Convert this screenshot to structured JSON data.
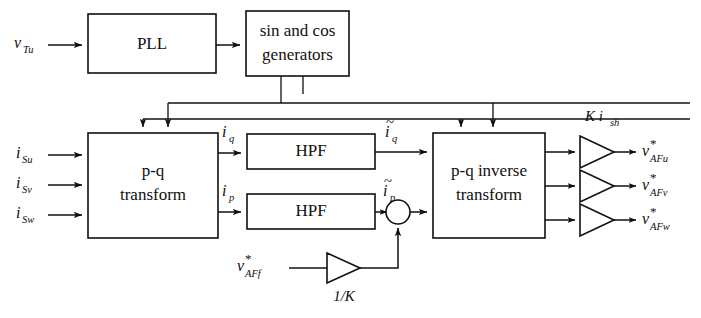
{
  "diagram": {
    "blocks": [
      {
        "id": "pll",
        "label": "PLL"
      },
      {
        "id": "sincos",
        "label_line1": "sin and cos",
        "label_line2": "generators"
      },
      {
        "id": "pq",
        "label_line1": "p-q",
        "label_line2": "transform"
      },
      {
        "id": "hpf_q",
        "label": "HPF"
      },
      {
        "id": "hpf_p",
        "label": "HPF"
      },
      {
        "id": "pqinv",
        "label_line1": "p-q inverse",
        "label_line2": "transform"
      }
    ],
    "inputs": [
      {
        "id": "vTu",
        "base": "v",
        "sub": "Tu",
        "star": false
      },
      {
        "id": "iSu",
        "base": "i",
        "sub": "Su",
        "star": false
      },
      {
        "id": "iSv",
        "base": "i",
        "sub": "Sv",
        "star": false
      },
      {
        "id": "iSw",
        "base": "i",
        "sub": "Sw",
        "star": false
      },
      {
        "id": "vAFf",
        "base": "v",
        "sub": "AFf",
        "star": true
      }
    ],
    "internal_signals": [
      {
        "id": "iq",
        "base": "i",
        "sub": "q",
        "tilde": false
      },
      {
        "id": "ip",
        "base": "i",
        "sub": "p",
        "tilde": false
      },
      {
        "id": "iq_tilde",
        "base": "i",
        "sub": "q",
        "tilde": true
      },
      {
        "id": "ip_tilde",
        "base": "i",
        "sub": "p",
        "tilde": true
      }
    ],
    "outputs": [
      {
        "id": "vAFu",
        "base": "v",
        "sub": "AFu",
        "star": true
      },
      {
        "id": "vAFv",
        "base": "v",
        "sub": "AFv",
        "star": true
      },
      {
        "id": "vAFw",
        "base": "v",
        "sub": "AFw",
        "star": true
      }
    ],
    "gains": [
      {
        "id": "gain_out",
        "base": "K i",
        "sub": "sh",
        "label_plain": "Ki_sh",
        "position": "above-output-triangles"
      },
      {
        "id": "gain_fb",
        "label_plain": "1/K",
        "position": "below-feedback-triangle"
      }
    ],
    "summing_junction": {
      "id": "sum",
      "inputs": 2,
      "shape": "circle"
    },
    "colors": {
      "line": "#101010",
      "text": "#101010",
      "background": "#ffffff"
    }
  }
}
